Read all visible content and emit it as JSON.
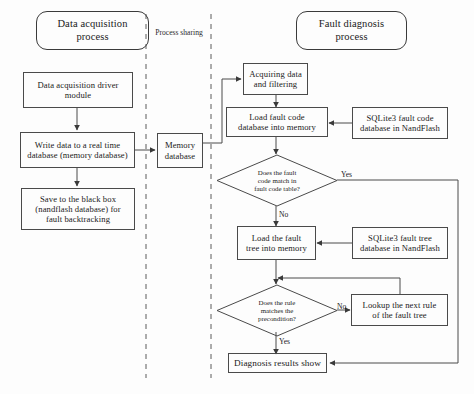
{
  "diagram": {
    "lanes": {
      "left_header": "Data acquisition\nprocess",
      "right_header": "Fault diagnosis\nprocess",
      "middle_label": "Process sharing"
    },
    "nodes": {
      "driver_module": "Data acquisition driver\nmodule",
      "write_realtime": "Write data to a real time\ndatabase (memory database)",
      "black_box": "Save to the black box\n(nandflash database) for\nfault backtracking",
      "memory_database": "Memory\ndatabase",
      "acquiring": "Acquiring  data\nand filtering",
      "load_fault_code": "Load fault code\ndatabase  into memory",
      "sqlite_fault_code": "SQLite3 fault code\ndatabase in NandFlash",
      "decision_fault_code": "Does the fault\ncode match in\nfault code table?",
      "load_fault_tree": "Load the fault\ntree into memory",
      "sqlite_fault_tree": "SQLite3 fault tree\ndatabase in NandFlash",
      "decision_rule": "Does the rule\nmatches the\nprecondition?",
      "lookup_next_rule": "Lookup the next rule\nof the fault tree",
      "diagnosis_results": "Diagnosis results show"
    },
    "edge_labels": {
      "fault_code_yes": "Yes",
      "fault_code_no": "No",
      "rule_no": "No",
      "rule_yes": "Yes"
    },
    "colors": {
      "stroke": "#4a4a4a",
      "text": "#1a1a1a",
      "background": "#fdfdfd",
      "dashed": "#5a5a5a"
    }
  }
}
